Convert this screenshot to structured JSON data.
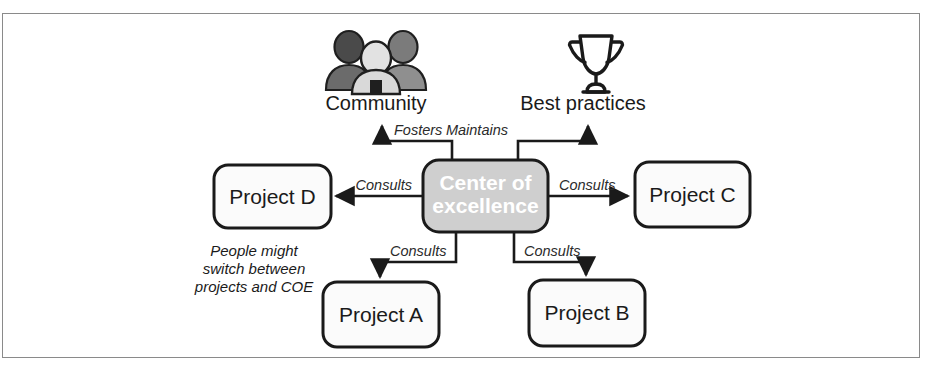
{
  "diagram": {
    "frame": {
      "border_color": "#8a8a8a",
      "background": "#ffffff"
    },
    "center_node": {
      "label_line1": "Center of",
      "label_line2": "excellence",
      "fill": "#cfcfcf",
      "text_color": "#ffffff"
    },
    "icons": [
      {
        "name": "community-icon",
        "label": "Community"
      },
      {
        "name": "trophy-icon",
        "label": "Best practices"
      }
    ],
    "nodes": [
      {
        "id": "project-d",
        "label": "Project D"
      },
      {
        "id": "project-c",
        "label": "Project C"
      },
      {
        "id": "project-a",
        "label": "Project A"
      },
      {
        "id": "project-b",
        "label": "Project B"
      }
    ],
    "edges": [
      {
        "id": "edge-community",
        "label": "Fosters",
        "from": "center",
        "to": "community"
      },
      {
        "id": "edge-best-practices",
        "label": "Maintains",
        "from": "center",
        "to": "best-practices"
      },
      {
        "id": "edge-project-d",
        "label": "Consults",
        "from": "center",
        "to": "project-d"
      },
      {
        "id": "edge-project-c",
        "label": "Consults",
        "from": "center",
        "to": "project-c"
      },
      {
        "id": "edge-project-a",
        "label": "Consults",
        "from": "center",
        "to": "project-a"
      },
      {
        "id": "edge-project-b",
        "label": "Consults",
        "from": "center",
        "to": "project-b"
      }
    ],
    "annotation": {
      "id": "people-switch-note",
      "line1": "People might",
      "line2": "switch between",
      "line3": "projects and COE"
    }
  }
}
